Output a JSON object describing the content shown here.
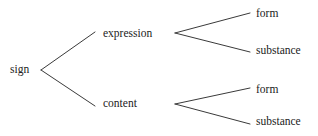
{
  "diagram": {
    "type": "tree",
    "background_color": "#ffffff",
    "line_color": "#3a3a3a",
    "text_color": "#222222",
    "nodes": {
      "root": "sign",
      "expression": "expression",
      "content": "content",
      "expression_form": "form",
      "expression_substance": "substance",
      "content_form": "form",
      "content_substance": "substance"
    },
    "edges": [
      {
        "from": "sign",
        "to": "expression"
      },
      {
        "from": "sign",
        "to": "content"
      },
      {
        "from": "expression",
        "to": "form"
      },
      {
        "from": "expression",
        "to": "substance"
      },
      {
        "from": "content",
        "to": "form"
      },
      {
        "from": "content",
        "to": "substance"
      }
    ]
  }
}
